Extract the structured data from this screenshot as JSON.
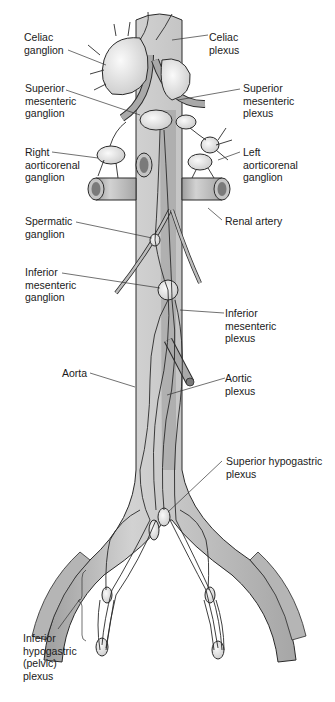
{
  "figure": {
    "colors": {
      "background": "#ffffff",
      "vessel_fill": "#b8b8b8",
      "vessel_highlight": "#d6d6d6",
      "vessel_lumen": "#7a7a7a",
      "ganglion_fill": "#e4e4e4",
      "nerve_stroke": "#2a2a2a",
      "leader_line": "#333333",
      "text": "#1a1a1a"
    }
  },
  "labels": {
    "celiac_ganglion": "Celiac\nganglion",
    "celiac_plexus": "Celiac\nplexus",
    "superior_mesenteric_ganglion": "Superior\nmesenteric\nganglion",
    "superior_mesenteric_plexus": "Superior\nmesenteric\nplexus",
    "right_aorticorenal_ganglion": "Right\naorticorenal\nganglion",
    "left_aorticorenal_ganglion": "Left\naorticorenal\nganglion",
    "spermatic_ganglion": "Spermatic\nganglion",
    "renal_artery": "Renal artery",
    "inferior_mesenteric_ganglion": "Inferior\nmesenteric\nganglion",
    "inferior_mesenteric_plexus": "Inferior\nmesenteric\nplexus",
    "aorta": "Aorta",
    "aortic_plexus": "Aortic\nplexus",
    "superior_hypogastric_plexus": "Superior hypogastric\nplexus",
    "inferior_hypogastric_plexus": "Inferior\nhypogastric\n(pelvic)\nplexus"
  }
}
